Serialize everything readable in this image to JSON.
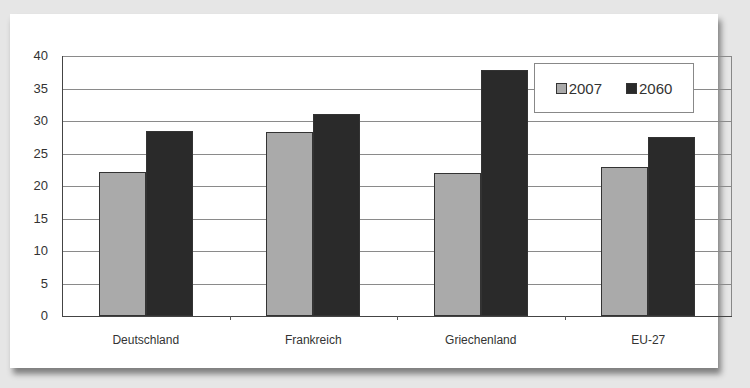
{
  "chart_data": {
    "type": "bar",
    "title": "",
    "xlabel": "",
    "ylabel": "",
    "categories": [
      "Deutschland",
      "Frankreich",
      "Griechenland",
      "EU-27"
    ],
    "series": [
      {
        "name": "2007",
        "color": "#aaaaaa",
        "values": [
          22.2,
          28.3,
          22.0,
          22.9
        ]
      },
      {
        "name": "2060",
        "color": "#2a2a2a",
        "values": [
          28.4,
          31.1,
          37.8,
          27.6
        ]
      }
    ],
    "ylim": [
      0,
      40
    ],
    "yticks": [
      "0",
      "5",
      "10",
      "15",
      "20",
      "25",
      "30",
      "35",
      "40"
    ],
    "grid": true,
    "legend_position": "top-right"
  },
  "legend": {
    "items": [
      {
        "label": "2007"
      },
      {
        "label": "2060"
      }
    ]
  }
}
